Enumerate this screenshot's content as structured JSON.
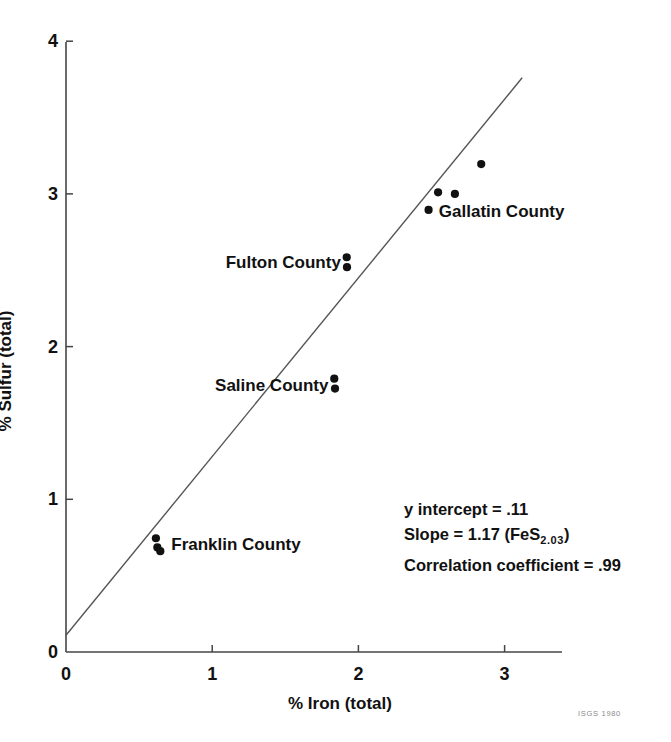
{
  "figure": {
    "credit": "ISGS  1980"
  },
  "chart_data": {
    "type": "scatter",
    "title": "",
    "xlabel": "% Iron (total)",
    "ylabel": "% Sulfur (total)",
    "xlim": [
      0,
      3.45
    ],
    "ylim": [
      0,
      4
    ],
    "xticks": [
      0,
      1,
      2,
      3
    ],
    "xtick_labels": [
      "0",
      "1",
      "2",
      "3"
    ],
    "yticks": [
      0,
      1,
      2,
      3,
      4
    ],
    "ytick_labels": [
      "0",
      "1",
      "2",
      "3",
      "4"
    ],
    "grid": false,
    "legend": "none",
    "marker_color": "#111111",
    "line_color": "#555555",
    "fit_line": {
      "intercept": 0.11,
      "slope": 1.17,
      "x_start": 0.0,
      "x_end": 3.12
    },
    "groups": [
      {
        "name": "Franklin County",
        "label_position": "right",
        "label_x": 0.72,
        "label_y": 0.7,
        "points": [
          {
            "x": 0.615,
            "y": 0.745
          },
          {
            "x": 0.625,
            "y": 0.685
          },
          {
            "x": 0.645,
            "y": 0.66
          }
        ]
      },
      {
        "name": "Saline County",
        "label_position": "left",
        "label_x": 1.795,
        "label_y": 1.745,
        "points": [
          {
            "x": 1.835,
            "y": 1.79
          },
          {
            "x": 1.84,
            "y": 1.725
          }
        ]
      },
      {
        "name": "Fulton County",
        "label_position": "left",
        "label_x": 1.88,
        "label_y": 2.545,
        "points": [
          {
            "x": 1.92,
            "y": 2.585
          },
          {
            "x": 1.922,
            "y": 2.52
          }
        ]
      },
      {
        "name": "Gallatin County",
        "label_position": "right",
        "label_x": 2.55,
        "label_y": 2.88,
        "points": [
          {
            "x": 2.48,
            "y": 2.895
          },
          {
            "x": 2.545,
            "y": 3.01
          },
          {
            "x": 2.66,
            "y": 3.0
          },
          {
            "x": 2.84,
            "y": 3.195
          }
        ]
      }
    ],
    "annotations": [
      {
        "id": "y-intercept",
        "text_prefix": "y intercept = ",
        "value": ".11"
      },
      {
        "id": "slope",
        "text_prefix": "Slope = ",
        "value": "1.17",
        "formula_open": " (FeS",
        "formula_sub": "2.03",
        "formula_close": ")"
      },
      {
        "id": "correlation",
        "text_prefix": "Correlation coefficient = ",
        "value": ".99"
      }
    ]
  }
}
